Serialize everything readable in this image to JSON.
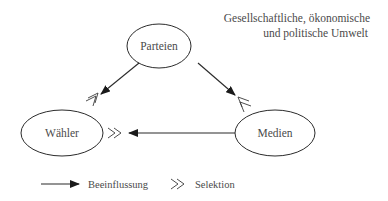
{
  "environment": {
    "line1": "Gesellschaftliche, ökonomische",
    "line2": "und politische Umwelt"
  },
  "nodes": {
    "parteien": {
      "label": "Parteien"
    },
    "waehler": {
      "label": "Wähler"
    },
    "medien": {
      "label": "Medien"
    }
  },
  "edges": [
    {
      "from": "Parteien",
      "to": "Wähler",
      "type": "Beeinflussung",
      "selection": true
    },
    {
      "from": "Parteien",
      "to": "Medien",
      "type": "Beeinflussung",
      "selection": true
    },
    {
      "from": "Medien",
      "to": "Wähler",
      "type": "Beeinflussung",
      "selection": true
    }
  ],
  "legend": {
    "influence_label": "Beeinflussung",
    "selection_label": "Selektion",
    "selection_glyph": "≫"
  },
  "colors": {
    "stroke": "#2b2b2b",
    "text": "#4a4a4a"
  }
}
